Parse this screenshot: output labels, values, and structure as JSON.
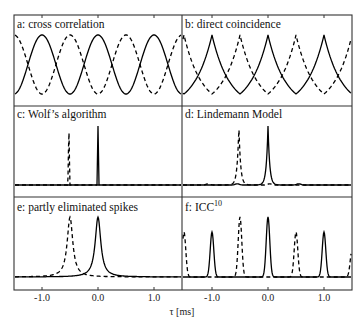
{
  "chart_data": {
    "type": "line",
    "layout": "3x2 panel grid, shared x-axis",
    "xlabel": "τ [ms]",
    "xlim": [
      -1.5,
      1.5
    ],
    "xticks": [
      -1.0,
      0.0,
      1.0
    ],
    "xtick_labels": [
      "-1.0",
      "0.0",
      "1.0"
    ],
    "grid": false,
    "legend": "none; solid line vs dashed line series",
    "panels": [
      {
        "id": "a",
        "title": "a: cross correlation",
        "shape": "sinusoidal",
        "series": [
          {
            "name": "solid",
            "style": "solid",
            "peaks_at": [
              -1.0,
              0.0,
              1.0
            ],
            "period": 1.0
          },
          {
            "name": "dashed",
            "style": "dashed",
            "peaks_at": [
              -1.5,
              -0.5,
              0.5,
              1.5
            ],
            "period": 1.0
          }
        ]
      },
      {
        "id": "b",
        "title": "b: direct coincidence",
        "shape": "cusped (exponential) periodic",
        "series": [
          {
            "name": "solid",
            "style": "solid",
            "peaks_at": [
              -1.0,
              0.0,
              1.0
            ],
            "period": 1.0
          },
          {
            "name": "dashed",
            "style": "dashed",
            "peaks_at": [
              -0.5,
              0.5,
              1.5
            ],
            "period": 1.0
          }
        ]
      },
      {
        "id": "c",
        "title": "c: Wolf's algorithm",
        "shape": "single narrow spike",
        "series": [
          {
            "name": "solid",
            "style": "solid",
            "peaks_at": [
              0.0
            ],
            "relative_height": 1.0
          },
          {
            "name": "dashed",
            "style": "dashed",
            "peaks_at": [
              -0.52
            ],
            "relative_height": 1.0
          }
        ]
      },
      {
        "id": "d",
        "title": "d: Lindemann Model",
        "shape": "single narrow peak with small side bumps",
        "series": [
          {
            "name": "solid",
            "style": "solid",
            "peaks_at": [
              0.0
            ],
            "relative_height": 1.0
          },
          {
            "name": "dashed",
            "style": "dashed",
            "peaks_at": [
              -0.52
            ],
            "relative_height": 1.0
          }
        ]
      },
      {
        "id": "e",
        "title": "e: partly eliminated spikes",
        "shape": "broadened peak",
        "series": [
          {
            "name": "solid",
            "style": "solid",
            "peaks_at": [
              0.0
            ],
            "relative_height": 1.0
          },
          {
            "name": "dashed",
            "style": "dashed",
            "peaks_at": [
              -0.5
            ],
            "relative_height": 1.0
          }
        ]
      },
      {
        "id": "f",
        "title": "f: ICC",
        "title_superscript": "10",
        "shape": "periodic narrow peaks",
        "series": [
          {
            "name": "solid",
            "style": "solid",
            "peaks_at": [
              -1.0,
              0.0,
              1.0
            ],
            "relative_heights": [
              0.75,
              1.0,
              0.75
            ]
          },
          {
            "name": "dashed",
            "style": "dashed",
            "peaks_at": [
              -1.5,
              -0.5,
              0.5,
              1.5
            ],
            "relative_heights": [
              0.75,
              1.0,
              0.75,
              0.45
            ]
          }
        ]
      }
    ]
  },
  "labels": {
    "panel_a": "a: cross correlation",
    "panel_b": "b: direct coincidence",
    "panel_c": "c: Wolf’s algorithm",
    "panel_d": "d: Lindemann Model",
    "panel_e": "e: partly eliminated spikes",
    "panel_f": "f: ICC",
    "panel_f_sup": "10",
    "xlabel": "τ [ms]",
    "ticks": [
      "-1.0",
      "0.0",
      "1.0"
    ]
  }
}
